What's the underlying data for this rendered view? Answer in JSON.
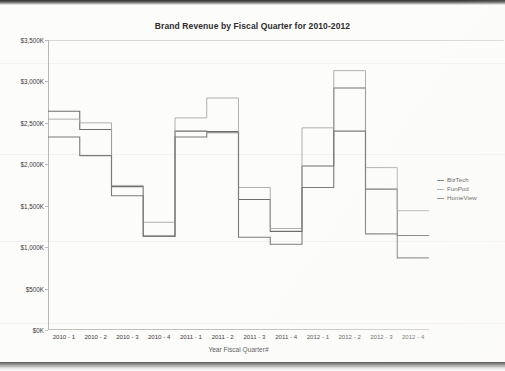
{
  "document": {
    "kind": "scanned-chart-page"
  },
  "chart_data": {
    "type": "line",
    "subtype": "step",
    "title": "Brand Revenue by Fiscal Quarter for 2010-2012",
    "xlabel": "Year Fiscal Quarter#",
    "ylabel": "",
    "categories": [
      "2010 - 1",
      "2010 - 2",
      "2010 - 3",
      "2010 - 4",
      "2011 - 1",
      "2011 - 2",
      "2011 - 3",
      "2011 - 4",
      "2012 - 1",
      "2012 - 2",
      "2012 - 3",
      "2012 - 4"
    ],
    "ylim": [
      0,
      3500
    ],
    "ytick_labels": [
      "$0K",
      "$500K",
      "$1,000K",
      "$1,500K",
      "$2,000K",
      "$2,500K",
      "$3,000K",
      "$3,500K"
    ],
    "ytick_values": [
      0,
      500,
      1000,
      1500,
      2000,
      2500,
      3000,
      3500
    ],
    "y_unit": "K",
    "grid": false,
    "legend_position": "right",
    "series": [
      {
        "name": "BizTech",
        "color": "#6e6e6c",
        "values": [
          2640,
          2420,
          1730,
          1135,
          2400,
          2395,
          1575,
          1190,
          1980,
          2920,
          1700,
          1140
        ]
      },
      {
        "name": "FunPod",
        "color": "#a8a7a4",
        "values": [
          2545,
          2500,
          1745,
          1300,
          2560,
          2800,
          1720,
          1225,
          2440,
          3130,
          1960,
          1440
        ]
      },
      {
        "name": "HomeView",
        "color": "#7c7b79",
        "values": [
          2330,
          2105,
          1620,
          1130,
          2330,
          2380,
          1120,
          1035,
          1720,
          2400,
          1160,
          870
        ]
      }
    ]
  },
  "legend": {
    "entries": [
      {
        "label": "BizTech"
      },
      {
        "label": "FunPod"
      },
      {
        "label": "HomeView"
      }
    ]
  }
}
